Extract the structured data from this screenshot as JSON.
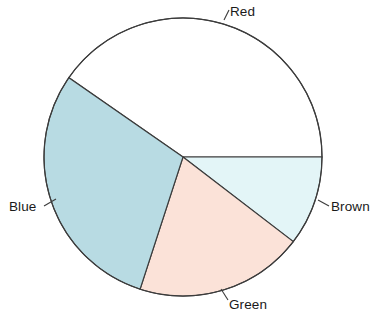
{
  "chart_data": {
    "type": "pie",
    "title": "",
    "subtitle": "",
    "xlabel": "",
    "ylabel": "",
    "legend_position": "none",
    "grid": false,
    "labels_placement": "outside-with-leader-lines",
    "start_angle_deg": 0,
    "direction": "clockwise",
    "categories": [
      "Red",
      "Brown",
      "Green",
      "Blue"
    ],
    "values": [
      40.3,
      10.4,
      19.6,
      29.7
    ],
    "value_unit": "percent",
    "angles_deg": [
      145.2,
      37.5,
      70.5,
      106.8
    ],
    "slices": [
      {
        "label": "Red",
        "value": 40.3,
        "angle_deg": 145.2,
        "start_deg": 214.8,
        "end_deg": 360.0,
        "fill": "#ffffff",
        "stroke": "#3c3c3c"
      },
      {
        "label": "Brown",
        "value": 10.4,
        "angle_deg": 37.5,
        "start_deg": 0.0,
        "end_deg": 37.5,
        "fill": "#e3f5f7",
        "stroke": "#3c3c3c"
      },
      {
        "label": "Green",
        "value": 19.6,
        "angle_deg": 70.5,
        "start_deg": 37.5,
        "end_deg": 108.0,
        "fill": "#fbe2d8",
        "stroke": "#3c3c3c"
      },
      {
        "label": "Blue",
        "value": 29.7,
        "angle_deg": 106.8,
        "start_deg": 108.0,
        "end_deg": 214.8,
        "fill": "#b8dbe3",
        "stroke": "#3c3c3c"
      }
    ],
    "geometry": {
      "center_x": 183,
      "center_y": 157,
      "radius": 139
    }
  },
  "labels": {
    "red": "Red",
    "brown": "Brown",
    "green": "Green",
    "blue": "Blue"
  },
  "colors": {
    "red_slice": "#ffffff",
    "brown_slice": "#e3f5f7",
    "green_slice": "#fbe2d8",
    "blue_slice": "#b8dbe3",
    "outline": "#3c3c3c",
    "background": "#ffffff",
    "text": "#1a1a1a"
  }
}
